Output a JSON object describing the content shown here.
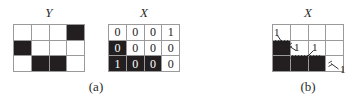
{
  "figure": {
    "panels": [
      {
        "id": "panel-a",
        "caption": "(a)",
        "matrices": [
          {
            "id": "matrix-y-a",
            "label": "Y",
            "rows": 3,
            "cols": 4,
            "show_values": false,
            "cells": [
              [
                {
                  "value": "",
                  "filled": false
                },
                {
                  "value": "",
                  "filled": false
                },
                {
                  "value": "",
                  "filled": false
                },
                {
                  "value": "",
                  "filled": true
                }
              ],
              [
                {
                  "value": "",
                  "filled": true
                },
                {
                  "value": "",
                  "filled": false
                },
                {
                  "value": "",
                  "filled": false
                },
                {
                  "value": "",
                  "filled": false
                }
              ],
              [
                {
                  "value": "",
                  "filled": false
                },
                {
                  "value": "",
                  "filled": true
                },
                {
                  "value": "",
                  "filled": true
                },
                {
                  "value": "",
                  "filled": false
                }
              ]
            ]
          },
          {
            "id": "matrix-x-a",
            "label": "X",
            "rows": 3,
            "cols": 4,
            "show_values": true,
            "cells": [
              [
                {
                  "value": "0",
                  "filled": false
                },
                {
                  "value": "0",
                  "filled": false
                },
                {
                  "value": "0",
                  "filled": false
                },
                {
                  "value": "1",
                  "filled": false
                }
              ],
              [
                {
                  "value": "0",
                  "filled": true
                },
                {
                  "value": "0",
                  "filled": false
                },
                {
                  "value": "0",
                  "filled": false
                },
                {
                  "value": "0",
                  "filled": false
                }
              ],
              [
                {
                  "value": "1",
                  "filled": true
                },
                {
                  "value": "0",
                  "filled": true
                },
                {
                  "value": "0",
                  "filled": true
                },
                {
                  "value": "0",
                  "filled": false
                }
              ]
            ]
          }
        ]
      },
      {
        "id": "panel-b",
        "caption": "(b)",
        "matrices": [
          {
            "id": "matrix-x-b",
            "label": "X",
            "rows": 3,
            "cols": 4,
            "show_values": false,
            "cells": [
              [
                {
                  "value": "",
                  "filled": false
                },
                {
                  "value": "",
                  "filled": false
                },
                {
                  "value": "",
                  "filled": false
                },
                {
                  "value": "",
                  "filled": false
                }
              ],
              [
                {
                  "value": "",
                  "filled": true
                },
                {
                  "value": "",
                  "filled": false
                },
                {
                  "value": "",
                  "filled": false
                },
                {
                  "value": "",
                  "filled": false
                }
              ],
              [
                {
                  "value": "",
                  "filled": true
                },
                {
                  "value": "",
                  "filled": true
                },
                {
                  "value": "",
                  "filled": true
                },
                {
                  "value": "",
                  "filled": false
                }
              ]
            ],
            "annotations": [
              {
                "id": "annot-1",
                "text": "1"
              },
              {
                "id": "annot-2",
                "text": "1"
              },
              {
                "id": "annot-3",
                "text": "1"
              },
              {
                "id": "annot-4",
                "text": "1"
              }
            ]
          }
        ]
      }
    ],
    "colors": {
      "filled_cell": "#231f20",
      "empty_cell": "#ffffff",
      "grid_line": "#9a9a9a",
      "text": "#1a1a1a",
      "background": "#ffffff"
    }
  }
}
